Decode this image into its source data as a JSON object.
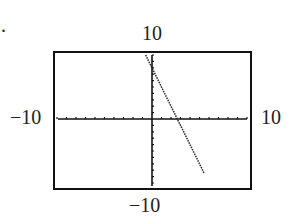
{
  "chart_data": {
    "type": "line",
    "title": "",
    "xlabel": "",
    "ylabel": "",
    "xlim": [
      -10,
      10
    ],
    "ylim": [
      -10,
      10
    ],
    "tick_spacing": 1,
    "grid": false,
    "tick_labels": {
      "top": "10",
      "bottom": "−10",
      "left": "−10",
      "right": "10"
    },
    "series": [
      {
        "name": "y = -3x + 8",
        "x": [
          -0.67,
          5.5
        ],
        "y": [
          10,
          -8.5
        ]
      }
    ]
  },
  "bullet": "."
}
